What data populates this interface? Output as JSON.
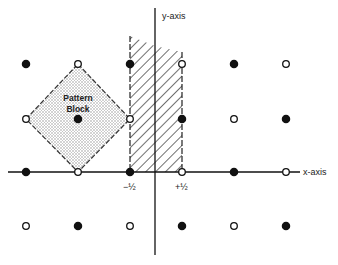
{
  "diagram": {
    "axes": {
      "x_label": "x-axis",
      "y_label": "y-axis",
      "tick_labels": [
        {
          "text": "−½",
          "x": 130
        },
        {
          "text": "+½",
          "x": 182
        }
      ]
    },
    "pattern_block": {
      "label_line1": "Pattern",
      "label_line2": "Block"
    },
    "grid": {
      "columns_x": [
        26,
        78,
        130,
        182,
        234,
        286
      ],
      "rows_y": [
        64,
        119,
        172,
        226
      ],
      "rows": [
        [
          "filled",
          "open",
          "filled",
          "open",
          "filled",
          "open"
        ],
        [
          "open",
          "filled",
          "open",
          "filled",
          "open",
          "filled"
        ],
        [
          "filled",
          "open",
          "filled",
          "open",
          "filled",
          "open"
        ],
        [
          "open",
          "filled",
          "open",
          "filled",
          "open",
          "filled"
        ]
      ]
    },
    "colors": {
      "ink": "#111111",
      "stipple": "#9a9a9a",
      "background": "#ffffff"
    }
  }
}
